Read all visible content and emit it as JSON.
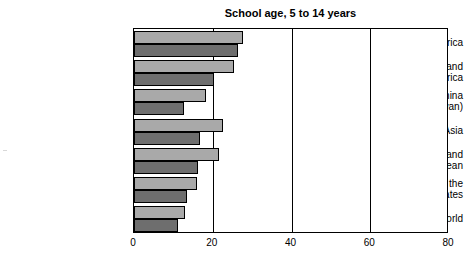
{
  "chart_data": {
    "type": "bar",
    "orientation": "horizontal",
    "title": "School age, 5 to 14 years",
    "xlabel": "",
    "ylabel": "",
    "xlim": [
      0,
      80
    ],
    "xticks": [
      "0",
      "20",
      "40",
      "60",
      "80"
    ],
    "xtick_values": [
      0,
      20,
      40,
      60,
      80
    ],
    "grid": "vertical gridlines at 20, 40, 60",
    "legend": "none",
    "categories": [
      "Sub-Saharan Africa",
      "Near East and\nNorth Africa",
      "China\n(Mainland and Taiwan)",
      "Other Asia",
      "Latin America and\nthe Caribbean",
      "Eastern Europe and the\nNew Independent States",
      "Rest of the World"
    ],
    "series": [
      {
        "name": "light-series",
        "color": "#a9a9a9",
        "values": [
          27.7,
          25.4,
          18.3,
          22.6,
          21.6,
          16.0,
          12.9
        ]
      },
      {
        "name": "dark-series",
        "color": "#6e6e6e",
        "values": [
          26.4,
          20.3,
          12.7,
          16.8,
          16.2,
          13.5,
          11.2
        ]
      }
    ]
  },
  "colors": {
    "light_bar": "#a9a9a9",
    "dark_bar": "#6e6e6e",
    "axis": "#000000",
    "background": "#ffffff"
  }
}
